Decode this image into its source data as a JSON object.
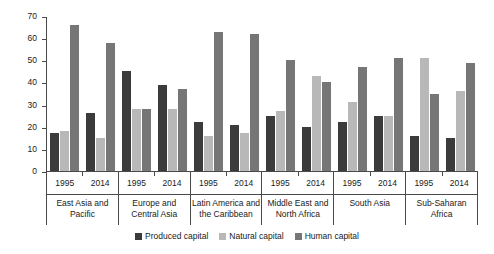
{
  "chart_data": {
    "type": "bar",
    "title": "",
    "subtitle": "",
    "xlabel": "",
    "ylabel": "",
    "ylim": [
      0,
      70
    ],
    "yticks": [
      0,
      10,
      20,
      30,
      40,
      50,
      60,
      70
    ],
    "grid": false,
    "legend_position": "bottom",
    "categories": [
      "East Asia and Pacific 1995",
      "East Asia and Pacific 2014",
      "Europe and Central Asia 1995",
      "Europe and Central Asia 2014",
      "Latin America and the Caribbean 1995",
      "Latin America and the Caribbean 2014",
      "Middle East and North Africa 1995",
      "Middle East and North Africa 2014",
      "South Asia 1995",
      "South Asia 2014",
      "Sub-Saharan Africa 1995",
      "Sub-Saharan Africa 2014"
    ],
    "series": [
      {
        "name": "Produced capital",
        "color": "#3b3b3b",
        "values": [
          17,
          26,
          45,
          39,
          22,
          21,
          25,
          20,
          22,
          25,
          16,
          15
        ]
      },
      {
        "name": "Natural capital",
        "color": "#b8b8b8",
        "values": [
          18,
          15,
          28,
          28,
          16,
          17,
          27,
          43,
          31,
          25,
          51,
          36
        ]
      },
      {
        "name": "Human capital",
        "color": "#767676",
        "values": [
          66,
          58,
          28,
          37,
          63,
          62,
          50,
          40,
          47,
          51,
          35,
          49
        ]
      }
    ],
    "regions": [
      {
        "name_line1": "East Asia and",
        "name_line2": "Pacific",
        "years": [
          {
            "label": "1995",
            "produced": 17,
            "natural": 18,
            "human": 66
          },
          {
            "label": "2014",
            "produced": 26,
            "natural": 15,
            "human": 58
          }
        ]
      },
      {
        "name_line1": "Europe and",
        "name_line2": "Central Asia",
        "years": [
          {
            "label": "1995",
            "produced": 45,
            "natural": 28,
            "human": 28
          },
          {
            "label": "2014",
            "produced": 39,
            "natural": 28,
            "human": 37
          }
        ]
      },
      {
        "name_line1": "Latin America and",
        "name_line2": "the Caribbean",
        "years": [
          {
            "label": "1995",
            "produced": 22,
            "natural": 16,
            "human": 63
          },
          {
            "label": "2014",
            "produced": 21,
            "natural": 17,
            "human": 62
          }
        ]
      },
      {
        "name_line1": "Middle East and",
        "name_line2": "North Africa",
        "years": [
          {
            "label": "1995",
            "produced": 25,
            "natural": 27,
            "human": 50
          },
          {
            "label": "2014",
            "produced": 20,
            "natural": 43,
            "human": 40
          }
        ]
      },
      {
        "name_line1": "South Asia",
        "name_line2": "",
        "years": [
          {
            "label": "1995",
            "produced": 22,
            "natural": 31,
            "human": 47
          },
          {
            "label": "2014",
            "produced": 25,
            "natural": 25,
            "human": 51
          }
        ]
      },
      {
        "name_line1": "Sub-Saharan",
        "name_line2": "Africa",
        "years": [
          {
            "label": "1995",
            "produced": 16,
            "natural": 51,
            "human": 35
          },
          {
            "label": "2014",
            "produced": 15,
            "natural": 36,
            "human": 49
          }
        ]
      }
    ],
    "legend": [
      {
        "label": "Produced capital",
        "color": "#3b3b3b"
      },
      {
        "label": "Natural capital",
        "color": "#b8b8b8"
      },
      {
        "label": "Human capital",
        "color": "#767676"
      }
    ]
  }
}
